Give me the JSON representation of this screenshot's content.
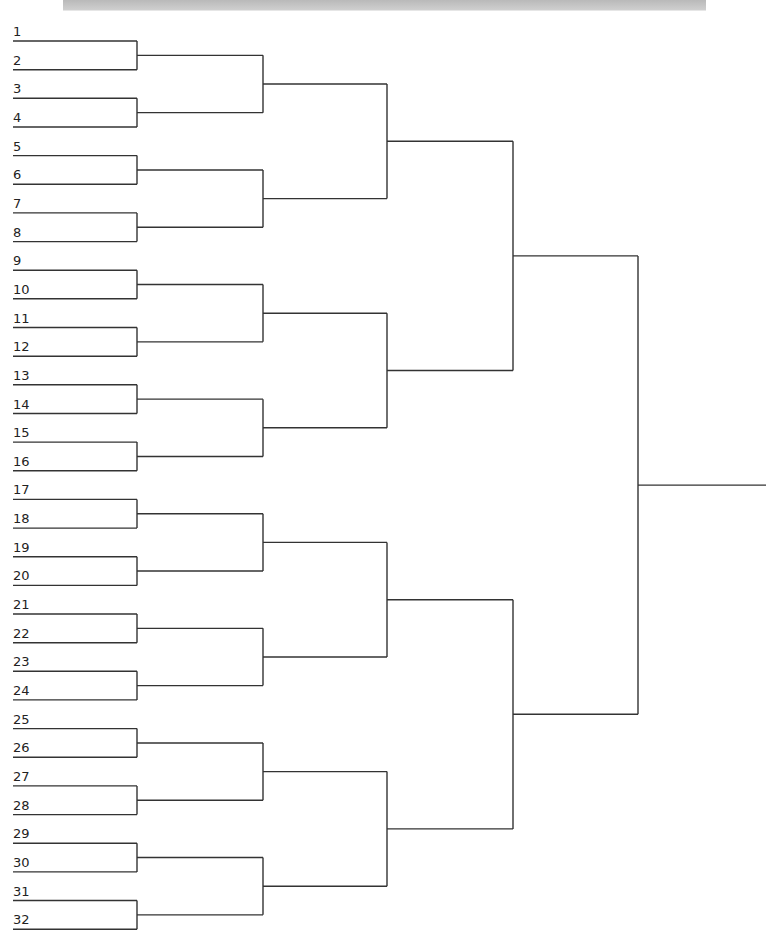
{
  "bracket": {
    "type": "single-elimination",
    "team_count": 32,
    "seeds": [
      "1",
      "2",
      "3",
      "4",
      "5",
      "6",
      "7",
      "8",
      "9",
      "10",
      "11",
      "12",
      "13",
      "14",
      "15",
      "16",
      "17",
      "18",
      "19",
      "20",
      "21",
      "22",
      "23",
      "24",
      "25",
      "26",
      "27",
      "28",
      "29",
      "30",
      "31",
      "32"
    ],
    "rounds": 5,
    "line_color": "#333333",
    "header_bar_color": "#c4c4c4"
  }
}
